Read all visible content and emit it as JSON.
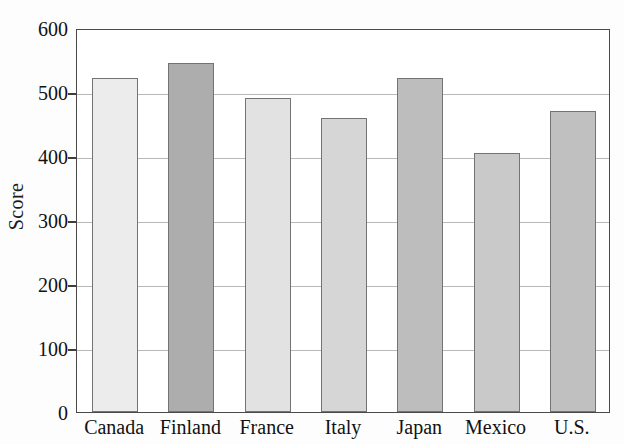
{
  "chart_data": {
    "type": "bar",
    "title": "",
    "xlabel": "",
    "ylabel": "Score",
    "categories": [
      "Canada",
      "Finland",
      "France",
      "Italy",
      "Japan",
      "Mexico",
      "U.S."
    ],
    "values": [
      522,
      545,
      490,
      460,
      522,
      405,
      470
    ],
    "bar_colors": [
      "#ececec",
      "#adadad",
      "#e2e2e2",
      "#d6d6d6",
      "#bdbdbd",
      "#c9c9c9",
      "#c0c0c0"
    ],
    "ylim": [
      0,
      600
    ],
    "yticks": [
      0,
      100,
      200,
      300,
      400,
      500,
      600
    ],
    "ytick_labels": [
      "0",
      "100",
      "200",
      "300",
      "400",
      "500",
      "600"
    ],
    "grid": true,
    "grid_axis": "y",
    "legend": "none",
    "bar_edge_color": "#737373",
    "frame_color": "#4a4a4a",
    "gridline_color": "#b9b9b9",
    "background": "#ffffff"
  }
}
